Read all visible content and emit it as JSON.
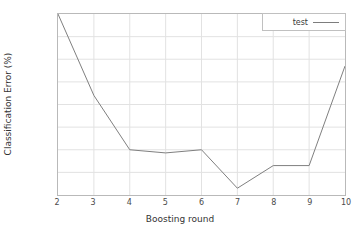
{
  "chart_data": {
    "type": "line",
    "title": "",
    "xlabel": "Boosting round",
    "ylabel": "Classification Error (%)",
    "x": [
      2,
      3,
      4,
      5,
      6,
      7,
      8,
      9,
      10
    ],
    "xlim": [
      2,
      10
    ],
    "ylim": [
      9.05,
      9.45
    ],
    "xticks": [
      "2",
      "3",
      "4",
      "5",
      "6",
      "7",
      "8",
      "9",
      "10"
    ],
    "yticks": [
      "9.05",
      "9.1",
      "9.15",
      "9.2",
      "9.25",
      "9.3",
      "9.35",
      "9.4",
      "9.45"
    ],
    "grid": true,
    "legend_position": "top-right",
    "series": [
      {
        "name": "test",
        "color": "#7d7d7d",
        "values": [
          9.45,
          9.27,
          9.15,
          9.143,
          9.15,
          9.065,
          9.115,
          9.115,
          9.335
        ]
      }
    ]
  },
  "style": {
    "line_color": "#7d7d7d",
    "grid_color": "#e2e2e2",
    "frame_color": "#b9b9b9",
    "background": "#ffffff",
    "text_color": "#3a3a3a"
  },
  "legend": {
    "entries": [
      {
        "label": "test",
        "swatch": "line-swatch-icon"
      }
    ]
  }
}
